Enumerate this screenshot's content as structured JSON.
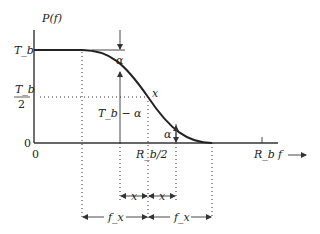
{
  "diagram": {
    "y_axis_label": "P(f)",
    "x_axis_label": "f",
    "y_ticks": {
      "top": "T_b",
      "half_num": "T_b",
      "half_den": "2",
      "zero": "0"
    },
    "x_ticks": {
      "origin": "0",
      "half": "R_b/2",
      "full": "R_b"
    },
    "annotations": {
      "alpha_top": "α",
      "tb_minus_alpha": "T_b − α",
      "x_curve": "x",
      "alpha_bottom": "α",
      "x_left": "x",
      "x_right": "x",
      "fx_left": "f_x",
      "fx_right": "f_x"
    }
  }
}
